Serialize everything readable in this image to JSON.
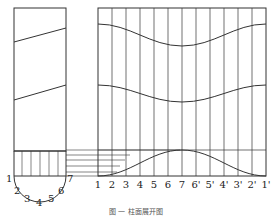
{
  "diagram": {
    "type": "cylinder-surface-development",
    "front_view": {
      "base_labels": [
        "1",
        "2",
        "3",
        "4",
        "5",
        "6",
        "7"
      ]
    },
    "development": {
      "station_labels": [
        "1",
        "2",
        "3",
        "4",
        "5",
        "6",
        "7",
        "6'",
        "5'",
        "4'",
        "3'",
        "2'",
        "1'"
      ]
    },
    "caption": "图 一 柱面展开图"
  },
  "colors": {
    "line": "#333333",
    "background": "#ffffff"
  }
}
